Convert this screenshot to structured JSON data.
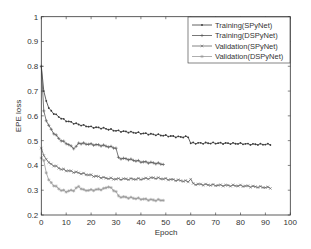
{
  "chart_data": {
    "type": "line",
    "title": "",
    "xlabel": "Epoch",
    "ylabel": "EPE loss",
    "xlim": [
      0,
      100
    ],
    "ylim": [
      0.2,
      1.0
    ],
    "xticks": [
      0,
      10,
      20,
      30,
      40,
      50,
      60,
      70,
      80,
      90,
      100
    ],
    "yticks": [
      0.2,
      0.3,
      0.4,
      0.5,
      0.6,
      0.7,
      0.8,
      0.9,
      1
    ],
    "xtick_labels": [
      "0",
      "10",
      "20",
      "30",
      "40",
      "50",
      "60",
      "70",
      "80",
      "90",
      "100"
    ],
    "ytick_labels": [
      "0.2",
      "0.3",
      "0.4",
      "0.5",
      "0.6",
      "0.7",
      "0.8",
      "0.9",
      "1"
    ],
    "grid": false,
    "legend_position": "upper right",
    "series": [
      {
        "name": "Training(SPyNet)",
        "color": "#3a3a3a",
        "marker": "dot",
        "x": [
          0,
          1,
          2,
          3,
          5,
          8,
          10,
          15,
          20,
          25,
          30,
          35,
          40,
          45,
          50,
          55,
          59,
          60,
          70,
          80,
          85,
          92
        ],
        "y": [
          0.8,
          0.7,
          0.66,
          0.63,
          0.61,
          0.59,
          0.58,
          0.565,
          0.555,
          0.55,
          0.54,
          0.535,
          0.53,
          0.525,
          0.52,
          0.515,
          0.515,
          0.49,
          0.49,
          0.488,
          0.485,
          0.485
        ]
      },
      {
        "name": "Training(DSPyNet)",
        "color": "#555555",
        "marker": "plus",
        "x": [
          0,
          1,
          2,
          3,
          5,
          8,
          10,
          13,
          14,
          15,
          20,
          25,
          30,
          31,
          35,
          40,
          45,
          49
        ],
        "y": [
          0.8,
          0.62,
          0.58,
          0.56,
          0.53,
          0.5,
          0.49,
          0.47,
          0.475,
          0.49,
          0.485,
          0.48,
          0.47,
          0.43,
          0.425,
          0.415,
          0.41,
          0.405
        ]
      },
      {
        "name": "Validation(SPyNet)",
        "color": "#666666",
        "marker": "x",
        "x": [
          0,
          1,
          3,
          5,
          8,
          10,
          15,
          20,
          25,
          30,
          35,
          40,
          45,
          50,
          55,
          59,
          60,
          61,
          70,
          80,
          92
        ],
        "y": [
          0.47,
          0.44,
          0.41,
          0.4,
          0.385,
          0.38,
          0.37,
          0.36,
          0.35,
          0.345,
          0.345,
          0.345,
          0.35,
          0.345,
          0.34,
          0.335,
          0.345,
          0.325,
          0.32,
          0.318,
          0.31
        ]
      },
      {
        "name": "Validation(DSPyNet)",
        "color": "#999999",
        "marker": "star",
        "x": [
          0,
          1,
          2,
          3,
          5,
          8,
          10,
          13,
          15,
          17,
          20,
          25,
          27,
          29,
          30,
          31,
          35,
          40,
          45,
          49
        ],
        "y": [
          0.43,
          0.42,
          0.37,
          0.34,
          0.32,
          0.3,
          0.295,
          0.3,
          0.315,
          0.3,
          0.3,
          0.305,
          0.315,
          0.3,
          0.295,
          0.275,
          0.27,
          0.265,
          0.26,
          0.26
        ]
      }
    ]
  }
}
